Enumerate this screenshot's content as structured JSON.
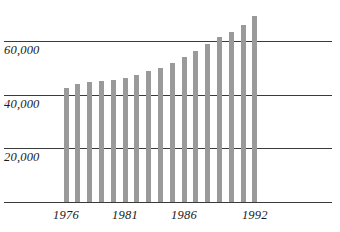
{
  "chart_data": {
    "type": "bar",
    "title": "",
    "subtitle": "",
    "xlabel": "",
    "ylabel": "",
    "categories": [
      "1976",
      "1977",
      "1978",
      "1979",
      "1980",
      "1981",
      "1982",
      "1983",
      "1984",
      "1985",
      "1986",
      "1987",
      "1988",
      "1989",
      "1990",
      "1991",
      "1992"
    ],
    "values": [
      42500,
      44000,
      44800,
      45200,
      45700,
      46500,
      47600,
      48800,
      50200,
      51800,
      54200,
      56600,
      59000,
      61800,
      63500,
      66000,
      69500
    ],
    "series": [
      {
        "name": "",
        "values": [
          42500,
          44000,
          44800,
          45200,
          45700,
          46500,
          47600,
          48800,
          50200,
          51800,
          54200,
          56600,
          59000,
          61800,
          63500,
          66000,
          69500
        ]
      }
    ],
    "ylim": [
      0,
      72500
    ],
    "xlim_labels": [
      "1976",
      "1992"
    ],
    "y_ticks": [
      20000,
      40000,
      60000
    ],
    "y_tick_labels": [
      "20,000",
      "40,000",
      "60,000"
    ],
    "x_tick_labels": [
      "1976",
      "1981",
      "1986",
      "1992"
    ],
    "x_tick_categories": [
      "1976",
      "1981",
      "1986",
      "1992"
    ],
    "grid": true,
    "grid_axis": "y",
    "legend": false,
    "legend_position": "none",
    "bar_color": "#9a9a9a",
    "gridline_color": "#3a3a3a",
    "axis_color": "#3a3a3a",
    "text_color": "#1a1a1a",
    "background_color": "#ffffff"
  }
}
